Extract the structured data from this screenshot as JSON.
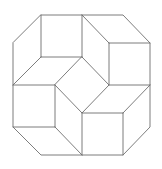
{
  "diagram": {
    "stroke_color": "#6e6e6e",
    "background": "#ffffff",
    "outline": [
      [
        41,
        15
      ],
      [
        123,
        15
      ],
      [
        150,
        43
      ],
      [
        150,
        127
      ],
      [
        123,
        155
      ],
      [
        41,
        155
      ],
      [
        13,
        127
      ],
      [
        13,
        43
      ]
    ],
    "center_diamond": [
      [
        82,
        57
      ],
      [
        109,
        85
      ],
      [
        82,
        113
      ],
      [
        55,
        85
      ]
    ],
    "segments": [
      [
        41,
        15,
        41,
        57
      ],
      [
        41,
        57,
        82,
        57
      ],
      [
        82,
        15,
        82,
        57
      ],
      [
        41,
        57,
        13,
        85
      ],
      [
        13,
        85,
        55,
        85
      ],
      [
        82,
        15,
        109,
        43
      ],
      [
        109,
        43,
        150,
        43
      ],
      [
        109,
        43,
        109,
        85
      ],
      [
        109,
        85,
        150,
        85
      ],
      [
        55,
        85,
        55,
        127
      ],
      [
        13,
        127,
        55,
        127
      ],
      [
        55,
        127,
        82,
        155
      ],
      [
        82,
        113,
        82,
        155
      ],
      [
        82,
        113,
        123,
        113
      ],
      [
        123,
        113,
        123,
        155
      ],
      [
        123,
        113,
        150,
        85
      ]
    ]
  }
}
